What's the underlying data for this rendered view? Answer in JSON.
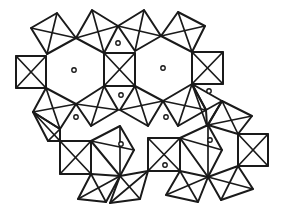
{
  "figure": {
    "colors": {
      "line": "#1a1a1a",
      "background": "#ffffff",
      "atom_fill": "#ffffff"
    },
    "squares": [
      {
        "id": "s1",
        "pts": [
          [
            31,
            28
          ],
          [
            57,
            13
          ],
          [
            76,
            38
          ],
          [
            47,
            54
          ]
        ]
      },
      {
        "id": "s2",
        "pts": [
          [
            76,
            38
          ],
          [
            92,
            10
          ],
          [
            118,
            26
          ],
          [
            104,
            53
          ]
        ]
      },
      {
        "id": "s3",
        "pts": [
          [
            118,
            26
          ],
          [
            144,
            10
          ],
          [
            161,
            36
          ],
          [
            135,
            51
          ]
        ]
      },
      {
        "id": "s4",
        "pts": [
          [
            161,
            36
          ],
          [
            178,
            12
          ],
          [
            205,
            26
          ],
          [
            192,
            52
          ]
        ]
      },
      {
        "id": "s5",
        "pts": [
          [
            16,
            56
          ],
          [
            46,
            56
          ],
          [
            46,
            88
          ],
          [
            16,
            88
          ]
        ]
      },
      {
        "id": "s6",
        "pts": [
          [
            104,
            53
          ],
          [
            135,
            53
          ],
          [
            135,
            86
          ],
          [
            104,
            86
          ]
        ]
      },
      {
        "id": "s7",
        "pts": [
          [
            192,
            52
          ],
          [
            223,
            52
          ],
          [
            223,
            84
          ],
          [
            192,
            84
          ]
        ]
      },
      {
        "id": "s8",
        "pts": [
          [
            46,
            88
          ],
          [
            76,
            104
          ],
          [
            60,
            129
          ],
          [
            33,
            112
          ]
        ]
      },
      {
        "id": "s9",
        "pts": [
          [
            76,
            104
          ],
          [
            104,
            86
          ],
          [
            118,
            110
          ],
          [
            91,
            126
          ]
        ]
      },
      {
        "id": "s10",
        "pts": [
          [
            135,
            86
          ],
          [
            163,
            101
          ],
          [
            148,
            126
          ],
          [
            120,
            110
          ]
        ]
      },
      {
        "id": "s11",
        "pts": [
          [
            163,
            101
          ],
          [
            192,
            84
          ],
          [
            206,
            110
          ],
          [
            178,
            126
          ]
        ]
      },
      {
        "id": "s12",
        "pts": [
          [
            192,
            84
          ],
          [
            222,
            101
          ],
          [
            207,
            126
          ],
          [
            206,
            110
          ]
        ]
      },
      {
        "id": "s13",
        "pts": [
          [
            60,
            141
          ],
          [
            91,
            141
          ],
          [
            91,
            174
          ],
          [
            60,
            174
          ]
        ]
      },
      {
        "id": "s14",
        "pts": [
          [
            148,
            138
          ],
          [
            180,
            138
          ],
          [
            180,
            171
          ],
          [
            148,
            171
          ]
        ]
      },
      {
        "id": "s15",
        "pts": [
          [
            238,
            134
          ],
          [
            268,
            134
          ],
          [
            268,
            166
          ],
          [
            238,
            166
          ]
        ]
      },
      {
        "id": "s16",
        "pts": [
          [
            91,
            174
          ],
          [
            120,
            176
          ],
          [
            106,
            202
          ],
          [
            78,
            199
          ]
        ]
      },
      {
        "id": "s17",
        "pts": [
          [
            120,
            176
          ],
          [
            148,
            171
          ],
          [
            140,
            199
          ],
          [
            110,
            203
          ]
        ]
      },
      {
        "id": "s18",
        "pts": [
          [
            180,
            171
          ],
          [
            208,
            177
          ],
          [
            198,
            202
          ],
          [
            166,
            195
          ]
        ]
      },
      {
        "id": "s19",
        "pts": [
          [
            208,
            177
          ],
          [
            238,
            166
          ],
          [
            253,
            189
          ],
          [
            221,
            200
          ]
        ]
      },
      {
        "id": "s20",
        "pts": [
          [
            91,
            141
          ],
          [
            120,
            126
          ],
          [
            134,
            150
          ],
          [
            120,
            176
          ]
        ]
      },
      {
        "id": "s21",
        "pts": [
          [
            180,
            138
          ],
          [
            208,
            125
          ],
          [
            222,
            150
          ],
          [
            208,
            177
          ]
        ]
      },
      {
        "id": "s22",
        "pts": [
          [
            208,
            125
          ],
          [
            238,
            134
          ],
          [
            252,
            116
          ],
          [
            222,
            101
          ]
        ]
      },
      {
        "id": "s23",
        "pts": [
          [
            33,
            112
          ],
          [
            60,
            129
          ],
          [
            60,
            141
          ],
          [
            48,
            141
          ]
        ]
      }
    ],
    "atoms": [
      {
        "id": "a1",
        "x": 74,
        "y": 70,
        "r": 2.2
      },
      {
        "id": "a2",
        "x": 118,
        "y": 43,
        "r": 2.2
      },
      {
        "id": "a3",
        "x": 163,
        "y": 68,
        "r": 2.2
      },
      {
        "id": "a4",
        "x": 209,
        "y": 91,
        "r": 2.2
      },
      {
        "id": "a5",
        "x": 121,
        "y": 95,
        "r": 2.2
      },
      {
        "id": "a6",
        "x": 166,
        "y": 117,
        "r": 2.2
      },
      {
        "id": "a7",
        "x": 76,
        "y": 117,
        "r": 2.2
      },
      {
        "id": "a8",
        "x": 121,
        "y": 144,
        "r": 2.2
      },
      {
        "id": "a9",
        "x": 165,
        "y": 165,
        "r": 2.2
      },
      {
        "id": "a10",
        "x": 210,
        "y": 140,
        "r": 2.2
      }
    ]
  }
}
